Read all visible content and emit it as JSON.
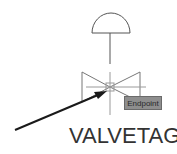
{
  "diagram": {
    "symbol": "control-valve-with-diaphragm-actuator",
    "snap_tooltip": "Endpoint",
    "valve_tag": "VALVETAG",
    "colors": {
      "line": "#555555",
      "arrow": "#1a1a1a",
      "tooltip_bg": "#8e8e8e",
      "crosshair": "#9a9a9a"
    }
  }
}
